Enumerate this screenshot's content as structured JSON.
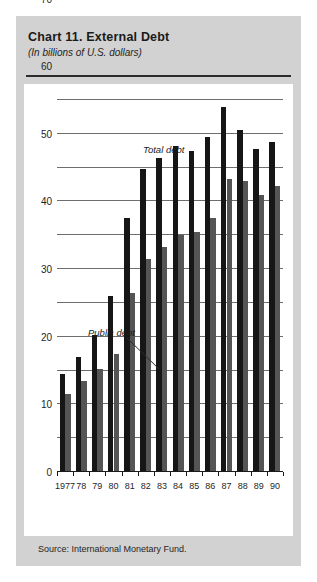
{
  "figure": {
    "title": "Chart 11. External Debt",
    "subtitle": "(In billions of U.S. dollars)",
    "source": "Source:  International Monetary Fund."
  },
  "annotations": {
    "total": "Total debt",
    "public": "Public debt"
  },
  "colors": {
    "panel_background": "#d2d2d2",
    "plot_background": "#ffffff",
    "total_bar": "#161616",
    "public_bar": "#555555",
    "gridline": "#6e6e6e",
    "axis": "#1a1a1a"
  },
  "chart_data": {
    "type": "bar",
    "title": "Chart 11. External Debt",
    "subtitle": "(In billions of U.S. dollars)",
    "xlabel": "",
    "ylabel": "",
    "ylim": [
      0,
      110
    ],
    "yticks": [
      0,
      10,
      20,
      30,
      40,
      50,
      60,
      70,
      80,
      90,
      100,
      110
    ],
    "ytick_labels": [
      "0",
      "10",
      "20",
      "30",
      "40",
      "50",
      "60",
      "70",
      "80",
      "90",
      "100",
      "110"
    ],
    "grid": true,
    "legend": "annotated-inline",
    "categories": [
      "1977",
      "78",
      "79",
      "80",
      "81",
      "82",
      "83",
      "84",
      "85",
      "86",
      "87",
      "88",
      "89",
      "90"
    ],
    "series": [
      {
        "name": "Total debt",
        "color": "#161616",
        "values": [
          29,
          34,
          40.5,
          52,
          75,
          89.5,
          93,
          96.5,
          95,
          99,
          108,
          101,
          95.5,
          97.5
        ]
      },
      {
        "name": "Public debt",
        "color": "#555555",
        "values": [
          23,
          27,
          30.5,
          35,
          53,
          63,
          66.5,
          70,
          71,
          75,
          86.5,
          86,
          82,
          84.5
        ]
      }
    ],
    "annotations": [
      {
        "text": "Total debt",
        "target": "total-debt-series"
      },
      {
        "text": "Public debt",
        "target": "public-debt-series",
        "leader_line": true
      }
    ],
    "source": "Source:  International Monetary Fund."
  }
}
